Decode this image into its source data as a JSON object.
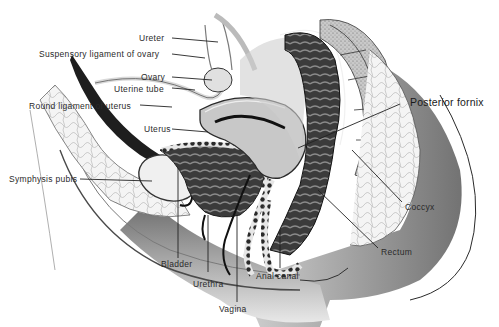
{
  "diagram": {
    "type": "anatomical-illustration",
    "labels": [
      {
        "id": "ureter",
        "text": "Ureter"
      },
      {
        "id": "suspensory-ligament",
        "text": "Suspensory ligament of ovary"
      },
      {
        "id": "ovary",
        "text": "Ovary"
      },
      {
        "id": "uterine-tube",
        "text": "Uterine tube"
      },
      {
        "id": "round-ligament",
        "text": "Round ligament of uterus"
      },
      {
        "id": "uterus",
        "text": "Uterus"
      },
      {
        "id": "symphysis-pubis",
        "text": "Symphysis pubis"
      },
      {
        "id": "bladder",
        "text": "Bladder"
      },
      {
        "id": "urethra",
        "text": "Urethra"
      },
      {
        "id": "vagina",
        "text": "Vagina"
      },
      {
        "id": "anal-canal",
        "text": "Anal canal"
      },
      {
        "id": "rectum",
        "text": "Rectum"
      },
      {
        "id": "coccyx",
        "text": "Coccyx"
      },
      {
        "id": "posterior-fornix",
        "text": "Posterior fornix"
      }
    ],
    "colors": {
      "background": "#ffffff",
      "ink": "#1e1e1e",
      "shade_dark": "#3a3a3a",
      "shade_mid": "#8a8a8a",
      "shade_light": "#d4d4d4"
    }
  }
}
